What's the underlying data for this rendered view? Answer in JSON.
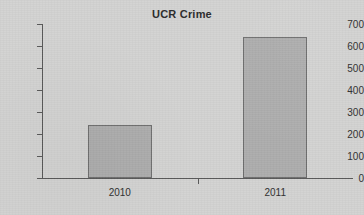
{
  "chart_data": {
    "type": "bar",
    "title": "UCR Crime",
    "xlabel": "",
    "ylabel": "",
    "categories": [
      "2010",
      "2011"
    ],
    "values": [
      240,
      640
    ],
    "ylim": [
      0,
      700
    ],
    "yticks": [
      0,
      100,
      200,
      300,
      400,
      500,
      600,
      700
    ],
    "ytick_labels": [
      "0",
      "100",
      "200",
      "300",
      "400",
      "500",
      "600",
      "700"
    ],
    "grid": false,
    "legend": null,
    "series": [
      {
        "name": "UCR Crime",
        "values": [
          240,
          640
        ]
      }
    ],
    "colors": {
      "bar_fill": "#adadad",
      "bar_border": "#6e6e6e",
      "axis": "#5a5a5a",
      "text": "#2f2f2f",
      "background": "#d3d3d2"
    }
  }
}
